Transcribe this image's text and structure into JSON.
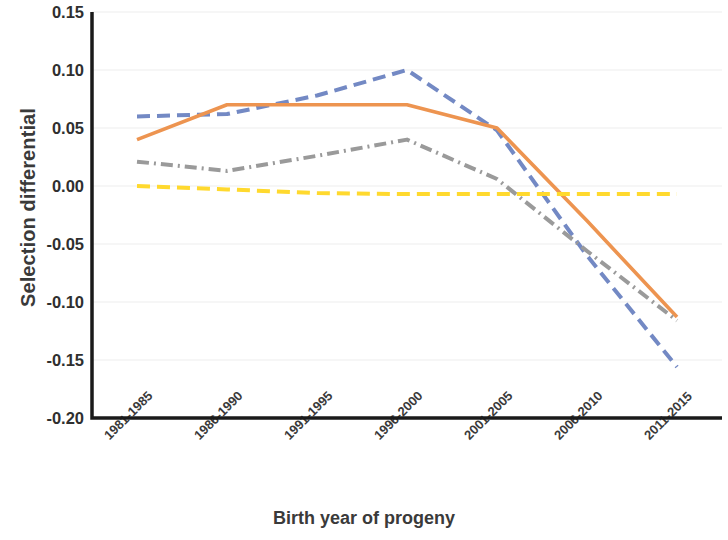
{
  "chart_data": {
    "type": "line",
    "title": "",
    "xlabel": "Birth year of progeny",
    "ylabel": "Selection differential",
    "categories": [
      "1981-1985",
      "1986-1990",
      "1991-1995",
      "1996-2000",
      "2001-2005",
      "2006-2010",
      "2011-2015"
    ],
    "ylim": [
      -0.2,
      0.15
    ],
    "yticks": [
      "0.15",
      "0.10",
      "0.05",
      "0.00",
      "-0.05",
      "-0.10",
      "-0.15",
      "-0.20"
    ],
    "ytick_values": [
      0.15,
      0.1,
      0.05,
      0.0,
      -0.05,
      -0.1,
      -0.15,
      -0.2
    ],
    "grid": true,
    "grid_axis": "y",
    "legend": "none",
    "series": [
      {
        "name": "series-blue",
        "color": "#7389c4",
        "style": "dashed",
        "values": [
          0.06,
          0.062,
          0.078,
          0.1,
          0.048,
          -0.06,
          -0.156
        ]
      },
      {
        "name": "series-orange",
        "color": "#ed9450",
        "style": "solid",
        "values": [
          0.04,
          0.07,
          0.07,
          0.07,
          0.05,
          -0.03,
          -0.113
        ]
      },
      {
        "name": "series-gray",
        "color": "#9a9a9a",
        "style": "dash-dot",
        "values": [
          0.021,
          0.013,
          0.026,
          0.04,
          0.006,
          -0.056,
          -0.116
        ]
      },
      {
        "name": "series-yellow",
        "color": "#ffd92e",
        "style": "dashed",
        "values": [
          0.0,
          -0.003,
          -0.006,
          -0.007,
          -0.007,
          -0.007,
          -0.007
        ]
      }
    ]
  }
}
